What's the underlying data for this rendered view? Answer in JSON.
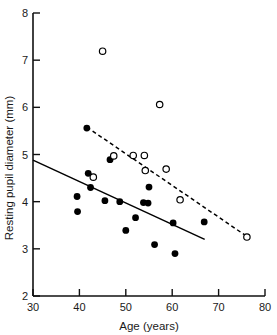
{
  "chart_data": {
    "type": "scatter",
    "title": "",
    "xlabel": "Age (years)",
    "ylabel": "Resting pupil diameter (mm)",
    "xlim": [
      30,
      80
    ],
    "ylim": [
      2,
      8
    ],
    "xticks": [
      30,
      40,
      50,
      60,
      70,
      80
    ],
    "yticks": [
      2,
      3,
      4,
      5,
      6,
      7,
      8
    ],
    "xtick_labels": [
      "30",
      "40",
      "50",
      "60",
      "70",
      "80"
    ],
    "ytick_labels": [
      "2",
      "3",
      "4",
      "5",
      "6",
      "7",
      "8"
    ],
    "grid": false,
    "legend": "none",
    "series": [
      {
        "name": "filled-circles",
        "marker": "filled-circle",
        "color": "#000000",
        "points": [
          {
            "x": 39.5,
            "y": 4.11
          },
          {
            "x": 39.6,
            "y": 3.79
          },
          {
            "x": 41.6,
            "y": 5.56
          },
          {
            "x": 41.9,
            "y": 4.6
          },
          {
            "x": 42.4,
            "y": 4.3
          },
          {
            "x": 45.5,
            "y": 4.02
          },
          {
            "x": 46.6,
            "y": 4.89
          },
          {
            "x": 48.7,
            "y": 4.0
          },
          {
            "x": 50.0,
            "y": 3.39
          },
          {
            "x": 52.1,
            "y": 3.66
          },
          {
            "x": 53.8,
            "y": 3.98
          },
          {
            "x": 54.8,
            "y": 3.97
          },
          {
            "x": 55.0,
            "y": 4.31
          },
          {
            "x": 56.2,
            "y": 3.09
          },
          {
            "x": 60.2,
            "y": 3.55
          },
          {
            "x": 60.6,
            "y": 2.9
          },
          {
            "x": 66.9,
            "y": 3.57
          }
        ]
      },
      {
        "name": "open-circles",
        "marker": "open-circle",
        "color": "#000000",
        "points": [
          {
            "x": 45.0,
            "y": 7.19
          },
          {
            "x": 57.3,
            "y": 6.06
          },
          {
            "x": 43.0,
            "y": 4.52
          },
          {
            "x": 47.4,
            "y": 4.97
          },
          {
            "x": 51.6,
            "y": 4.98
          },
          {
            "x": 54.0,
            "y": 4.98
          },
          {
            "x": 54.2,
            "y": 4.66
          },
          {
            "x": 58.7,
            "y": 4.69
          },
          {
            "x": 61.7,
            "y": 4.04
          },
          {
            "x": 76.1,
            "y": 3.25
          }
        ]
      }
    ],
    "trend_lines": [
      {
        "name": "solid-regression-line",
        "style": "solid",
        "color": "#000000",
        "x1": 30.0,
        "y1": 4.88,
        "x2": 67.0,
        "y2": 3.2
      },
      {
        "name": "dashed-regression-line",
        "style": "dashed",
        "color": "#000000",
        "x1": 41.6,
        "y1": 5.58,
        "x2": 76.3,
        "y2": 3.25
      }
    ]
  }
}
